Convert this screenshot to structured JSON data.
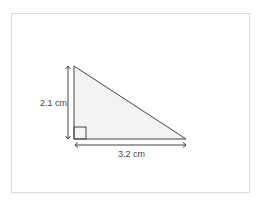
{
  "diagram": {
    "type": "right-triangle",
    "height_label": "2.1 cm",
    "base_label": "3.2 cm",
    "fill_color": "#f3f3f3",
    "stroke_color": "#444444"
  }
}
